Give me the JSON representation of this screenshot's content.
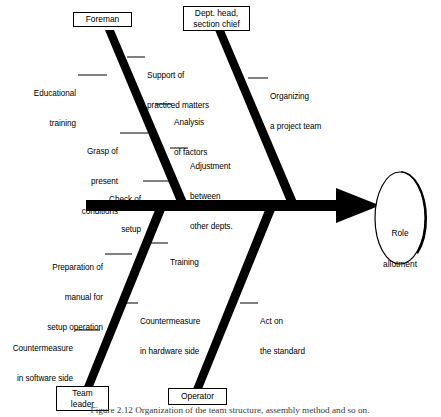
{
  "figure": {
    "type": "fishbone-ishikawa-diagram",
    "caption": "Figure 2.12  Organization of the team structure, assembly method and so on.",
    "effect": {
      "label_line1": "Role",
      "label_line2": "allotment",
      "shape": "ellipse-with-drop-shadow"
    },
    "spine": {
      "name": "main-spine-arrow",
      "direction": "left-to-right"
    },
    "branches": [
      {
        "id": "foreman",
        "head_label": "Foreman",
        "position": "upper-left",
        "causes": [
          {
            "id": "educational-training",
            "text_line1": "Educational",
            "text_line2": "training",
            "side": "left"
          },
          {
            "id": "support-of-practiced-matters",
            "text_line1": "Support of",
            "text_line2": "practiced matters",
            "side": "right"
          },
          {
            "id": "analysis-of-factors",
            "text_line1": "Analysis",
            "text_line2": "of factors",
            "side": "right"
          },
          {
            "id": "grasp-of-present-conditions",
            "text_line1": "Grasp of",
            "text_line2": "present",
            "text_line3": "conditions",
            "side": "left"
          },
          {
            "id": "check-of-setup",
            "text_line1": "Check of",
            "text_line2": "setup",
            "side": "left"
          }
        ]
      },
      {
        "id": "dept-head-section-chief",
        "head_label_line1": "Dept. head,",
        "head_label_line2": "section chief",
        "position": "upper-right",
        "causes": [
          {
            "id": "organizing-a-project-team",
            "text_line1": "Organizing",
            "text_line2": "a project team",
            "side": "right"
          },
          {
            "id": "adjustment-between-other-depts",
            "text_line1": "Adjustment",
            "text_line2": "between",
            "text_line3": "other depts.",
            "side": "right"
          }
        ]
      },
      {
        "id": "team-leader",
        "head_label_line1": "Team",
        "head_label_line2": "leader",
        "position": "lower-left",
        "causes": [
          {
            "id": "training",
            "text_line1": "Training",
            "side": "right"
          },
          {
            "id": "preparation-of-manual-for-setup-operation",
            "text_line1": "Preparation of",
            "text_line2": "manual for",
            "text_line3": "setup operation",
            "side": "left"
          },
          {
            "id": "countermeasure-in-hardware-side",
            "text_line1": "Countermeasure",
            "text_line2": "in hardware side",
            "side": "right"
          },
          {
            "id": "countermeasure-in-software-side",
            "text_line1": "Countermeasure",
            "text_line2": "in software side",
            "side": "left"
          }
        ]
      },
      {
        "id": "operator",
        "head_label": "Operator",
        "position": "lower-right",
        "causes": [
          {
            "id": "act-on-the-standard",
            "text_line1": "Act on",
            "text_line2": "the standard",
            "side": "right"
          }
        ]
      }
    ],
    "colors": {
      "ink": "#000000",
      "background": "#ffffff",
      "caption": "#3a3a3a"
    }
  }
}
